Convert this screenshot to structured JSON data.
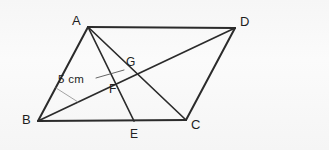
{
  "figure": {
    "background_color": "#f7f7f7",
    "stroke_color": "#2b2b2b",
    "label_color": "#1d1d1d",
    "width": 329,
    "height": 150,
    "vertices": [
      {
        "id": "A",
        "label": "A",
        "x": 88,
        "y": 27,
        "label_x": 72,
        "label_y": 14
      },
      {
        "id": "D",
        "label": "D",
        "x": 235,
        "y": 28,
        "label_x": 240,
        "label_y": 15
      },
      {
        "id": "C",
        "label": "C",
        "x": 186,
        "y": 120,
        "label_x": 191,
        "label_y": 118
      },
      {
        "id": "B",
        "label": "B",
        "x": 38,
        "y": 121,
        "label_x": 22,
        "label_y": 113
      }
    ],
    "points": [
      {
        "id": "E",
        "label": "E",
        "x": 134,
        "y": 121,
        "label_x": 130,
        "label_y": 128
      },
      {
        "id": "F",
        "label": "F",
        "x": 113,
        "y": 80,
        "label_x": 109,
        "label_y": 83
      },
      {
        "id": "G",
        "label": "G",
        "x": 130,
        "y": 72,
        "label_x": 126,
        "label_y": 56
      }
    ],
    "segments": [
      {
        "id": "AD",
        "from": "A",
        "to": "D",
        "kind": "side"
      },
      {
        "id": "BC",
        "from": "B",
        "to": "C",
        "kind": "side"
      },
      {
        "id": "AB",
        "from": "A",
        "to": "B",
        "kind": "side"
      },
      {
        "id": "DC",
        "from": "D",
        "to": "C",
        "kind": "side"
      },
      {
        "id": "BD",
        "from": "B",
        "to": "D",
        "kind": "diagonal"
      },
      {
        "id": "AC",
        "from": "A",
        "to": "C",
        "kind": "diagonal"
      },
      {
        "id": "AE",
        "from": "A",
        "to": "E",
        "kind": "cevian"
      }
    ],
    "measurements": [
      {
        "id": "measure-5cm",
        "text": "5 cm",
        "label_x": 58,
        "label_y": 74,
        "leader_upper": {
          "x1": 96,
          "y1": 78,
          "x2": 124,
          "y2": 70
        },
        "leader_lower": {
          "x1": 56,
          "y1": 88,
          "x2": 78,
          "y2": 102
        }
      }
    ]
  }
}
